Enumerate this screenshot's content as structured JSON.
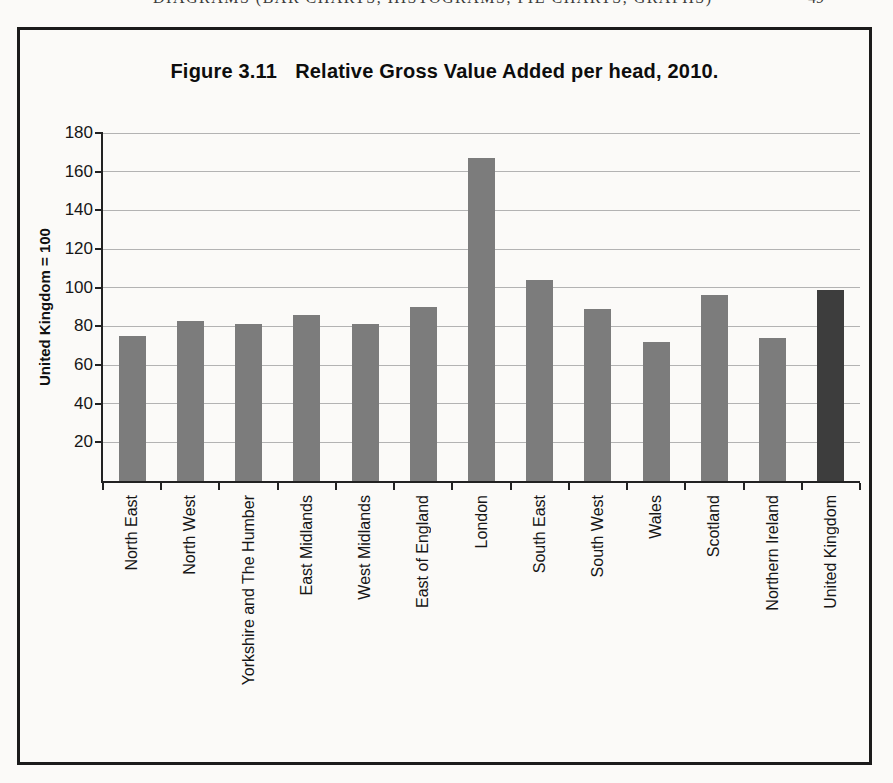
{
  "page": {
    "running_head": {
      "text": "DIAGRAMS (BAR CHARTS, HISTOGRAMS, PIE CHARTS, GRAPHS)",
      "page_number": "49"
    }
  },
  "figure": {
    "title_prefix": "Figure 3.11",
    "title_text": "Relative Gross Value Added per head, 2010."
  },
  "chart_data": {
    "type": "bar",
    "xlabel": "",
    "ylabel": "United Kingdom = 100",
    "ylim": [
      0,
      180
    ],
    "yticks": [
      20,
      40,
      60,
      80,
      100,
      120,
      140,
      160,
      180
    ],
    "grid": "horizontal",
    "legend": "none",
    "categories": [
      "North East",
      "North West",
      "Yorkshire and The Humber",
      "East Midlands",
      "West Midlands",
      "East of England",
      "London",
      "South East",
      "South West",
      "Wales",
      "Scotland",
      "Northern Ireland",
      "United Kingdom"
    ],
    "values": [
      75,
      83,
      81,
      86,
      81,
      90,
      167,
      104,
      89,
      72,
      96,
      74,
      99
    ],
    "highlight_category": "United Kingdom",
    "colors": {
      "bar_default": "#7c7c7c",
      "bar_highlight": "#3d3d3d",
      "gridline": "#b3b3b3",
      "axis": "#222222",
      "frame": "#1b1b1b"
    }
  }
}
